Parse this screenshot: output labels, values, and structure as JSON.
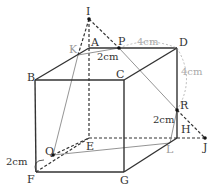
{
  "diagram": {
    "type": "cube-geometry",
    "vertices": {
      "A": {
        "label": "A",
        "x": 89,
        "y": 48
      },
      "B": {
        "label": "B",
        "x": 35,
        "y": 80
      },
      "C": {
        "label": "C",
        "x": 124,
        "y": 80
      },
      "D": {
        "label": "D",
        "x": 177,
        "y": 48
      },
      "E": {
        "label": "E",
        "x": 89,
        "y": 138
      },
      "F": {
        "label": "F",
        "x": 36,
        "y": 172
      },
      "G": {
        "label": "G",
        "x": 124,
        "y": 172
      },
      "H": {
        "label": "H",
        "x": 177,
        "y": 138
      }
    },
    "points": {
      "I": {
        "label": "I",
        "x": 89,
        "y": 19
      },
      "P": {
        "label": "P",
        "x": 119,
        "y": 48
      },
      "Q": {
        "label": "Q",
        "x": 53,
        "y": 155
      },
      "R": {
        "label": "R",
        "x": 177,
        "y": 110
      },
      "J": {
        "label": "J",
        "x": 205,
        "y": 138
      },
      "K": {
        "label": "K",
        "x": 78,
        "y": 55
      },
      "L": {
        "label": "L",
        "x": 170,
        "y": 143
      }
    },
    "measurements": {
      "AP": "2cm",
      "PD": "4cm",
      "DR": "4cm",
      "RH": "2cm",
      "FQ": "2cm"
    }
  }
}
